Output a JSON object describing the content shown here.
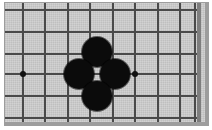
{
  "figure": {
    "kind": "go-board-diagram",
    "title": "",
    "board_color": "#c9c9c9",
    "frame_color": "#9d9d9d",
    "line_color": "#4a4a4a",
    "edge_color": "#7e7e7e",
    "black_stone_color": "#0b0b0b",
    "white_stone_color": "#f2f2f2",
    "star_point_color": "#111111"
  },
  "board": {
    "width_px": 200,
    "height_px": 119,
    "grid_spacing_px": 22.4,
    "origin_x_px": 18,
    "origin_y_px": 7,
    "columns": 9,
    "rows": 6,
    "vertical_lines": [
      18,
      40,
      63,
      85,
      108,
      130,
      153,
      175,
      190
    ],
    "horizontal_lines": [
      7,
      29,
      51,
      71,
      93,
      115
    ],
    "right_edge_x_px": 192
  },
  "star_points": [
    {
      "name": "hoshi-left",
      "x": 18,
      "y": 71
    },
    {
      "name": "hoshi-right",
      "x": 130,
      "y": 71
    }
  ],
  "stones": [
    {
      "name": "stone-north",
      "color": "black",
      "x": 92,
      "y": 49,
      "radius": 15
    },
    {
      "name": "stone-west",
      "color": "black",
      "x": 74,
      "y": 71,
      "radius": 15
    },
    {
      "name": "stone-east",
      "color": "black",
      "x": 110,
      "y": 71,
      "radius": 15
    },
    {
      "name": "stone-south",
      "color": "black",
      "x": 92,
      "y": 93,
      "radius": 15
    }
  ],
  "empty_points": [
    {
      "name": "center-empty-point",
      "x": 92,
      "y": 71
    }
  ],
  "labels": []
}
